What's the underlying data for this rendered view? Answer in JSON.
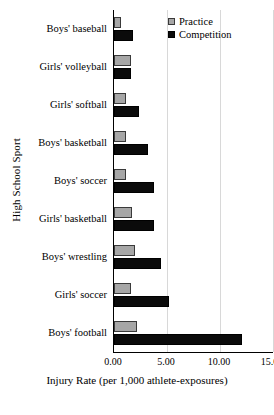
{
  "chart_data": {
    "type": "bar",
    "orientation": "horizontal",
    "title": "",
    "xlabel": "Injury Rate (per 1,000 athlete-exposures)",
    "ylabel": "High School Sport",
    "xlim": [
      0,
      15
    ],
    "xticks": [
      "0.00",
      "5.00",
      "10.00",
      "15.00"
    ],
    "xtick_values": [
      0,
      5,
      10,
      15
    ],
    "grid": "vertical",
    "legend_position": "top-right",
    "categories": [
      "Boys' baseball",
      "Girls' volleyball",
      "Girls' softball",
      "Boys' basketball",
      "Boys' soccer",
      "Girls' basketball",
      "Boys' wrestling",
      "Girls' soccer",
      "Boys' football"
    ],
    "series": [
      {
        "name": "Practice",
        "color": "#a6a6a6",
        "values": [
          0.7,
          1.6,
          1.1,
          1.1,
          1.1,
          1.7,
          2.0,
          1.6,
          2.2
        ]
      },
      {
        "name": "Competition",
        "color": "#0b0b0b",
        "values": [
          1.8,
          1.6,
          2.4,
          3.2,
          3.8,
          3.8,
          4.4,
          5.2,
          12.1
        ]
      }
    ]
  },
  "legend": {
    "items": [
      {
        "label": "Practice"
      },
      {
        "label": "Competition"
      }
    ]
  }
}
